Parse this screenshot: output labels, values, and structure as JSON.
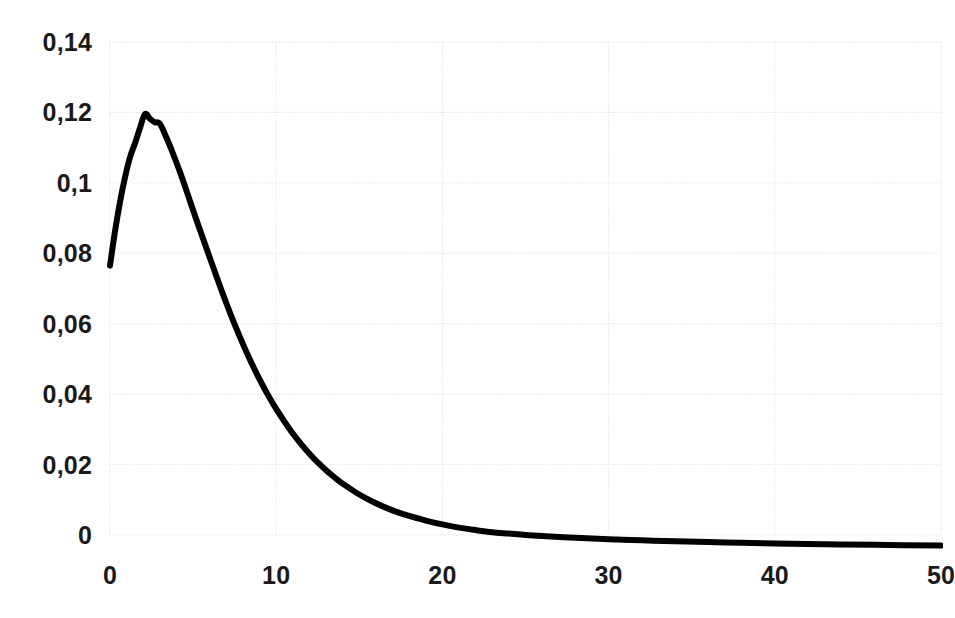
{
  "chart_data": {
    "type": "line",
    "title": "",
    "subtitle": "",
    "xlabel": "",
    "ylabel": "",
    "xlim": [
      0,
      50
    ],
    "ylim": [
      0,
      0.14
    ],
    "grid": true,
    "legend": null,
    "legend_position": "none",
    "decimal_separator": ",",
    "line_color": "#000000",
    "line_width": 6,
    "grid_color": "#d9d9d9",
    "background_color": "#ffffff",
    "text_color": "#1a1a1a",
    "y_ticks": [
      0,
      0.02,
      0.04,
      0.06,
      0.08,
      0.1,
      0.12,
      0.14
    ],
    "y_tick_labels": [
      "0",
      "0,02",
      "0,04",
      "0,06",
      "0,08",
      "0,1",
      "0,12",
      "0,14"
    ],
    "x_ticks": [
      0,
      10,
      20,
      30,
      40,
      50
    ],
    "x_tick_labels": [
      "0",
      "10",
      "20",
      "30",
      "40",
      "50"
    ],
    "series": [
      {
        "name": "curve",
        "x": [
          0,
          0.3,
          0.6,
          0.9,
          1.2,
          1.5,
          1.8,
          2.1,
          2.4,
          2.7,
          3.0,
          3.4,
          3.8,
          4.2,
          4.6,
          5.0,
          5.5,
          6.0,
          6.5,
          7.0,
          7.5,
          8.0,
          8.5,
          9.0,
          9.5,
          10.0,
          10.5,
          11.0,
          11.5,
          12.0,
          12.5,
          13.0,
          13.5,
          14.0,
          15.0,
          16.0,
          17.0,
          18.0,
          19.0,
          20.0,
          21.0,
          22.0,
          23.0,
          24.0,
          25.0,
          26.0,
          28.0,
          30.0,
          32.0,
          34.0,
          36.0,
          38.0,
          40.0,
          43.0,
          46.0,
          50.0
        ],
        "y": [
          0.0765,
          0.0862,
          0.0945,
          0.1015,
          0.1072,
          0.1112,
          0.1155,
          0.1195,
          0.1182,
          0.1172,
          0.1168,
          0.1128,
          0.1082,
          0.1032,
          0.0978,
          0.0922,
          0.0855,
          0.0788,
          0.0722,
          0.0658,
          0.0598,
          0.0542,
          0.049,
          0.0442,
          0.0398,
          0.0358,
          0.0322,
          0.0288,
          0.0258,
          0.0231,
          0.0206,
          0.0184,
          0.0164,
          0.0146,
          0.0115,
          0.009,
          0.007,
          0.0054,
          0.0041,
          0.003,
          0.0021,
          0.0014,
          0.0008,
          0.0004,
          0.0,
          -0.0003,
          -0.0008,
          -0.0012,
          -0.0015,
          -0.0018,
          -0.002,
          -0.0022,
          -0.0024,
          -0.0026,
          -0.0028,
          -0.003
        ]
      }
    ]
  }
}
